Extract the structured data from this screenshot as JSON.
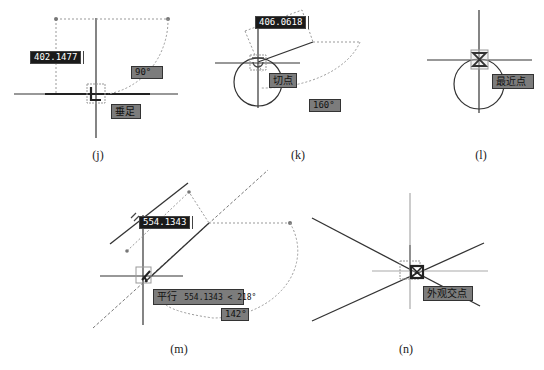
{
  "figures": [
    {
      "id": "j",
      "caption": "(j)",
      "snap_mode": "垂足",
      "distance_input": "402.1477",
      "angle": "90°"
    },
    {
      "id": "k",
      "caption": "(k)",
      "snap_mode": "切点",
      "distance_input": "406.0618",
      "angle": "160°"
    },
    {
      "id": "l",
      "caption": "(l)",
      "snap_mode": "最近点"
    },
    {
      "id": "m",
      "caption": "(m)",
      "snap_mode_label": "平行",
      "distance_input": "554.1343",
      "polar_readout": "554.1343 < 218°",
      "angle": "142°"
    },
    {
      "id": "n",
      "caption": "(n)",
      "snap_mode": "外观交点"
    }
  ],
  "colors": {
    "line": "#333333",
    "tracking": "#999999",
    "tooltip_bg": "#7c7c7c",
    "input_bg": "#1a1a1a"
  }
}
